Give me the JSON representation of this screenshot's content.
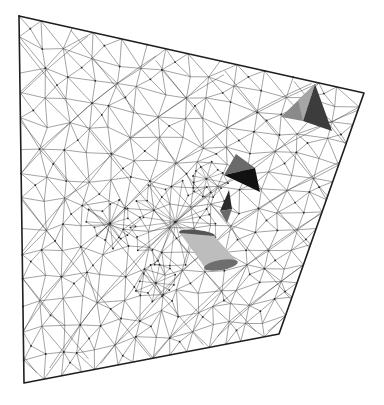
{
  "scene": {
    "title": "3D unstructured surface mesh with embedded solids",
    "background": "#ffffff",
    "domain_quad": {
      "top_left": [
        19,
        16
      ],
      "top_right": [
        364,
        93
      ],
      "bottom_right": [
        279,
        334
      ],
      "bottom_left": [
        24,
        383
      ],
      "stroke": "#1e1e1e"
    },
    "mesh": {
      "color": "#3a3a3a",
      "grid_u": 14,
      "grid_v": 14,
      "refinement_centers": [
        {
          "name": "wake-region",
          "uv": [
            0.52,
            0.55
          ],
          "spokes": 22,
          "radius": 0.16
        },
        {
          "name": "left-cluster",
          "uv": [
            0.3,
            0.56
          ],
          "spokes": 14,
          "radius": 0.08
        },
        {
          "name": "lower-cluster",
          "uv": [
            0.48,
            0.75
          ],
          "spokes": 12,
          "radius": 0.07
        },
        {
          "name": "upper-cluster",
          "uv": [
            0.6,
            0.4
          ],
          "spokes": 12,
          "radius": 0.07
        }
      ]
    },
    "solids": [
      {
        "name": "pyramid-large",
        "faces": [
          {
            "points": [
              [
                315,
                84
              ],
              [
                281,
                117
              ],
              [
                303,
                121
              ]
            ],
            "fill": "#8a8a8a"
          },
          {
            "points": [
              [
                315,
                84
              ],
              [
                303,
                121
              ],
              [
                332,
                131
              ]
            ],
            "fill": "#3c3c3c"
          },
          {
            "points": [
              [
                315,
                84
              ],
              [
                298,
                100
              ],
              [
                303,
                121
              ]
            ],
            "fill": "#a6a6a6"
          }
        ]
      },
      {
        "name": "pyramid-medium",
        "faces": [
          {
            "points": [
              [
                236,
                154
              ],
              [
                224,
                175
              ],
              [
                255,
                168
              ]
            ],
            "fill": "#6a6a6a"
          },
          {
            "points": [
              [
                224,
                175
              ],
              [
                255,
                168
              ],
              [
                260,
                192
              ]
            ],
            "fill": "#111111"
          }
        ]
      },
      {
        "name": "pyramid-small",
        "faces": [
          {
            "points": [
              [
                229,
                190
              ],
              [
                220,
                211
              ],
              [
                232,
                209
              ]
            ],
            "fill": "#2a2a2a"
          },
          {
            "points": [
              [
                220,
                211
              ],
              [
                232,
                209
              ],
              [
                227,
                223
              ]
            ],
            "fill": "#6a6a6a"
          }
        ]
      },
      {
        "name": "cylinder-wing",
        "body": {
          "points": [
            [
              180,
              233
            ],
            [
              214,
              236
            ],
            [
              238,
              262
            ],
            [
              206,
              269
            ]
          ],
          "fill": "#bdbdbd"
        },
        "top_cap": {
          "cx": 197,
          "cy": 234,
          "rx": 18,
          "ry": 4,
          "fill": "#555555"
        },
        "bottom_cap": {
          "cx": 221,
          "cy": 265,
          "rx": 17,
          "ry": 5,
          "fill": "#6e6e6e"
        }
      }
    ]
  }
}
